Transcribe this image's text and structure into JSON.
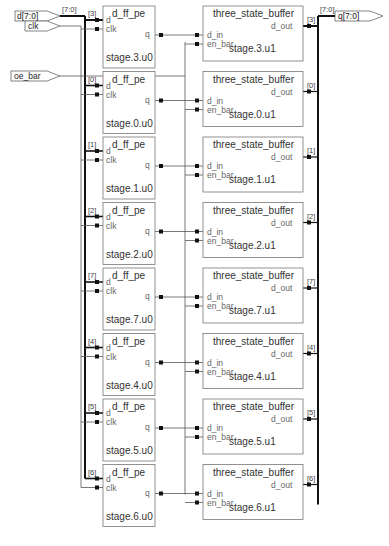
{
  "ports": {
    "inputs": [
      {
        "name": "d[7:0]",
        "bus": "[7:0]"
      },
      {
        "name": "clk"
      },
      {
        "name": "oe_bar"
      }
    ],
    "outputs": [
      {
        "name": "q[7:0]",
        "bus": "[7:0]"
      }
    ]
  },
  "flipflop": {
    "type": "d_ff_pe",
    "pins": {
      "d": "d",
      "clk": "clk",
      "q": "q"
    }
  },
  "buffer": {
    "type": "three_state_buffer",
    "pins": {
      "d_in": "d_in",
      "en_bar": "en_bar",
      "d_out": "d_out"
    }
  },
  "stages": [
    {
      "bit": "[3]",
      "ff": "stage.3.u0",
      "buf": "stage.3.u1"
    },
    {
      "bit": "[0]",
      "ff": "stage.0.u0",
      "buf": "stage.0.u1"
    },
    {
      "bit": "[1]",
      "ff": "stage.1.u0",
      "buf": "stage.1.u1"
    },
    {
      "bit": "[2]",
      "ff": "stage.2.u0",
      "buf": "stage.2.u1"
    },
    {
      "bit": "[7]",
      "ff": "stage.7.u0",
      "buf": "stage.7.u1"
    },
    {
      "bit": "[4]",
      "ff": "stage.4.u0",
      "buf": "stage.4.u1"
    },
    {
      "bit": "[5]",
      "ff": "stage.5.u0",
      "buf": "stage.5.u1"
    },
    {
      "bit": "[6]",
      "ff": "stage.6.u0",
      "buf": "stage.6.u1"
    }
  ],
  "colors": {
    "wire": "#555555",
    "bus": "#111111",
    "box": "#777777",
    "dot": "#111111"
  }
}
